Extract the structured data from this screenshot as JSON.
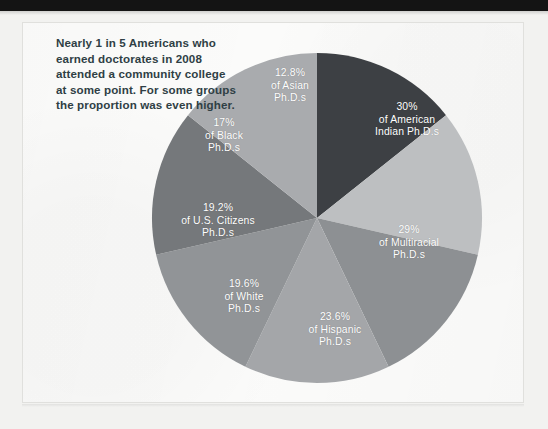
{
  "figure": {
    "caption": "Nearly 1 in 5 Americans who earned doctorates in 2008 attended a community college at some point. For some groups the proportion was even higher.",
    "caption_color": "#2f3f45",
    "panel_background": "#fbfbfa",
    "page_background": "#f2f2f0",
    "top_bar_color": "#141414"
  },
  "chart_data": {
    "type": "pie",
    "title": "",
    "subtitle": "",
    "xlabel": "",
    "ylabel": "",
    "legend_position": "on-slice",
    "grid": false,
    "label_color": "#ffffff",
    "center": {
      "x": 317,
      "y": 218
    },
    "radius": 165,
    "start_angle_deg": 0,
    "direction": "clockwise",
    "note": "Each wedge is drawn at an equal angular share; the percentage is the value annotated on the wedge.",
    "categories": [
      "American Indian Ph.D.s",
      "Multiracial Ph.D.s",
      "Hispanic Ph.D.s",
      "White Ph.D.s",
      "U.S. Citizens Ph.D.s",
      "Black Ph.D.s",
      "Asian Ph.D.s"
    ],
    "values": [
      30,
      29,
      23.6,
      19.6,
      19.2,
      17,
      12.8
    ],
    "value_labels": [
      "30%",
      "29%",
      "23.6%",
      "19.6%",
      "19.2%",
      "17%",
      "12.8%"
    ],
    "colors": [
      "#3d4044",
      "#bdbfc1",
      "#8d9093",
      "#a4a6a9",
      "#919497",
      "#75787b",
      "#a9abae"
    ],
    "slices": [
      {
        "name": "american-indian",
        "percent_label": "30%",
        "group_line1": "of American",
        "group_line2": "Indian Ph.D.s",
        "color": "#3d4044",
        "start_deg": 0,
        "end_deg": 51.43,
        "label_x": 407,
        "label_y": 120
      },
      {
        "name": "multiracial",
        "percent_label": "29%",
        "group_line1": "of Multiracial",
        "group_line2": "Ph.D.s",
        "color": "#bdbfc1",
        "start_deg": 51.43,
        "end_deg": 102.86,
        "label_x": 409,
        "label_y": 243
      },
      {
        "name": "hispanic",
        "percent_label": "23.6%",
        "group_line1": "of Hispanic",
        "group_line2": "Ph.D.s",
        "color": "#8d9093",
        "start_deg": 102.86,
        "end_deg": 154.29,
        "label_x": 335,
        "label_y": 330
      },
      {
        "name": "white",
        "percent_label": "19.6%",
        "group_line1": "of White",
        "group_line2": "Ph.D.s",
        "color": "#a4a6a9",
        "start_deg": 154.29,
        "end_deg": 205.71,
        "label_x": 244,
        "label_y": 297
      },
      {
        "name": "us-citizens",
        "percent_label": "19.2%",
        "group_line1": "of U.S. Citizens",
        "group_line2": "Ph.D.s",
        "color": "#919497",
        "start_deg": 205.71,
        "end_deg": 257.14,
        "label_x": 218,
        "label_y": 221
      },
      {
        "name": "black",
        "percent_label": "17%",
        "group_line1": "of Black",
        "group_line2": "Ph.D.s",
        "color": "#75787b",
        "start_deg": 257.14,
        "end_deg": 308.57,
        "label_x": 224,
        "label_y": 136
      },
      {
        "name": "asian",
        "percent_label": "12.8%",
        "group_line1": "of Asian",
        "group_line2": "Ph.D.s",
        "color": "#a9abae",
        "start_deg": 308.57,
        "end_deg": 360,
        "label_x": 290,
        "label_y": 86
      }
    ]
  }
}
